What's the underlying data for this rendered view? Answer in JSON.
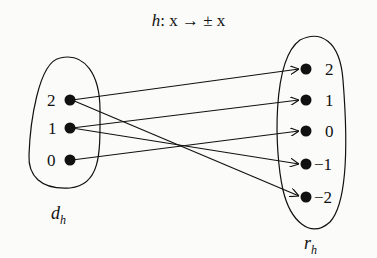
{
  "title": {
    "func": "h",
    "rest": ": x → ± x"
  },
  "domain_set": {
    "label": "d",
    "subscript": "h",
    "elements": [
      "2",
      "1",
      "0"
    ]
  },
  "range_set": {
    "label": "r",
    "subscript": "h",
    "elements": [
      "2",
      "1",
      "0",
      "−1",
      "−2"
    ]
  },
  "mappings": [
    {
      "from": "2",
      "to": "2"
    },
    {
      "from": "2",
      "to": "−2"
    },
    {
      "from": "1",
      "to": "1"
    },
    {
      "from": "1",
      "to": "−1"
    },
    {
      "from": "0",
      "to": "0"
    }
  ],
  "colors": {
    "ink": "#111111",
    "background": "#fbfbfa"
  }
}
